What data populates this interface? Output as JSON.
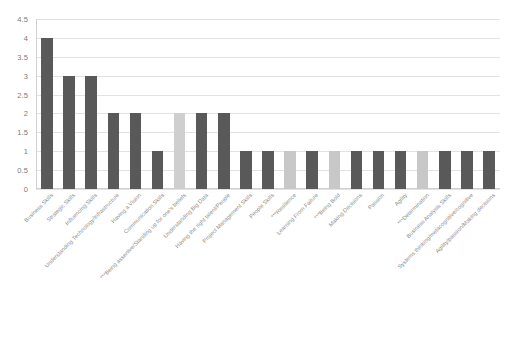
{
  "chart_data": {
    "type": "bar",
    "title": "",
    "subtitle": "",
    "xlabel": "",
    "ylabel": "",
    "ylim": [
      0,
      4.5
    ],
    "y_ticks": [
      "0",
      "0.5",
      "1",
      "1.5",
      "2",
      "2.5",
      "3",
      "3.5",
      "4",
      "4.5"
    ],
    "y_tick_values": [
      0,
      0.5,
      1,
      1.5,
      2,
      2.5,
      3,
      3.5,
      4,
      4.5
    ],
    "grid": "horizontal",
    "legend": "none",
    "categories": [
      "Business Skills",
      "Strategic Skills",
      "Influencing Skills",
      "Understanding Technology/Infrastructure",
      "Having a Vision",
      "Communication Skills",
      "***Being assertive/Standing up for one's beliefs",
      "Understanding Big Data",
      "Having the right talent/People",
      "Project Management Skills",
      "People Skills",
      "***Resilience",
      "Learning From Failure",
      "***Being Bold",
      "Making Decisions",
      "Passion",
      "Agility",
      "***Determination",
      "Business Analysis Skills",
      "Systems thinking/metacognitive/cognitive",
      "Agility/passion/Making decisions"
    ],
    "values": [
      4,
      3,
      3,
      2,
      2,
      1,
      2,
      2,
      2,
      1,
      1,
      1,
      1,
      1,
      1,
      1,
      1,
      1,
      1,
      1,
      1
    ],
    "bar_colors": [
      "#595959",
      "#595959",
      "#595959",
      "#595959",
      "#595959",
      "#595959",
      "#cfcfcf",
      "#595959",
      "#595959",
      "#595959",
      "#595959",
      "#c8c8c8",
      "#595959",
      "#c8c8c8",
      "#595959",
      "#595959",
      "#595959",
      "#c8c8c8",
      "#595959",
      "#595959",
      "#595959"
    ]
  },
  "colors": {
    "bar_dark": "#595959",
    "bar_light": "#cfcfcf",
    "gridline": "#e2e2e2",
    "axis": "#d0d0d0",
    "tick_text": "#7b7b7b",
    "label_text": "#8a8a8a",
    "background": "#ffffff"
  }
}
